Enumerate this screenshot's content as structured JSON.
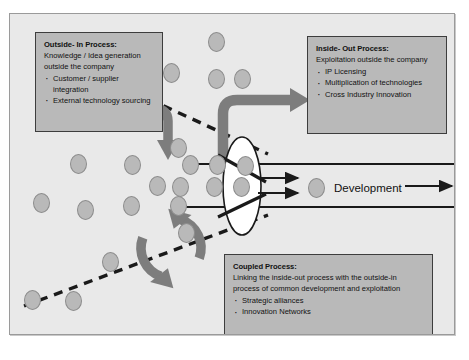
{
  "diagram": {
    "background_color": "#e9e9e9",
    "border_color": "#9a9a9a",
    "accent_color": "#7d7d7d",
    "box_fill": "#b9b9b9",
    "box_border": "#3d3d3d",
    "dot_fill": "#b9b9b9"
  },
  "boxes": {
    "outside_in": {
      "title": "Outside- In Process:",
      "subtitle": "Knowledge / Idea generation outside the company",
      "bullets": [
        "Customer / supplier integration",
        "External technology sourcing"
      ]
    },
    "inside_out": {
      "title": "Inside- Out Process:",
      "subtitle": "Exploitation outside the company",
      "bullets": [
        "IP Licensing",
        "Multiplication of technologies",
        "Cross Industry Innovation"
      ]
    },
    "coupled": {
      "title": "Coupled Process:",
      "subtitle": "Linking the inside-out process with the outside-in process of common development and exploitation",
      "bullets": [
        "Strategic alliances",
        "Innovation Networks"
      ]
    }
  },
  "labels": {
    "development": "Development"
  },
  "icons": {
    "outside_in_arrow": "arrow-down-curved-icon",
    "inside_out_arrow": "arrow-up-right-curved-icon",
    "coupled_arrow": "circular-cycle-arrow-icon",
    "funnel": "funnel-ellipse-icon",
    "output_arrow": "arrow-right-icon",
    "company_boundary": "dashed-boundary-line-icon",
    "idea_unit": "idea-dot-icon"
  },
  "dots": [
    [
      206,
      27
    ],
    [
      161,
      58
    ],
    [
      206,
      64
    ],
    [
      232,
      64
    ],
    [
      168,
      133
    ],
    [
      68,
      149
    ],
    [
      122,
      150
    ],
    [
      180,
      150
    ],
    [
      207,
      150
    ],
    [
      235,
      151
    ],
    [
      147,
      171
    ],
    [
      170,
      172
    ],
    [
      204,
      172
    ],
    [
      231,
      172
    ],
    [
      31,
      188
    ],
    [
      75,
      195
    ],
    [
      121,
      191
    ],
    [
      168,
      191
    ],
    [
      176,
      218
    ],
    [
      100,
      247
    ],
    [
      22,
      285
    ],
    [
      63,
      286
    ],
    [
      306,
      173
    ],
    [
      36,
      107
    ]
  ]
}
